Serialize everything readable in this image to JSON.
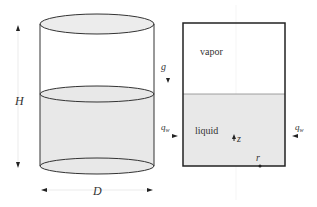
{
  "cylinder": {
    "height_label": "H",
    "diameter_label": "D"
  },
  "cross_section": {
    "vapor_label": "vapor",
    "liquid_label": "liquid",
    "gravity_label": "g",
    "heat_flux_left_label": "q",
    "heat_flux_left_sub": "w",
    "heat_flux_right_label": "q",
    "heat_flux_right_sub": "w",
    "z_axis_label": "z",
    "r_axis_label": "r"
  },
  "colors": {
    "liquid_fill": "#e8e8e8",
    "line": "#333333"
  }
}
